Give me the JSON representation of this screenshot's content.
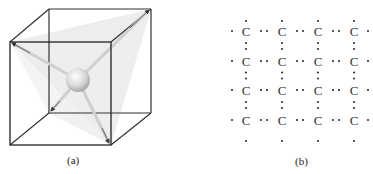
{
  "figure": {
    "panel_a": {
      "label": "(a)",
      "description": "Carbon atom at center of cube with four bonds to alternate corners (tetrahedral)"
    },
    "panel_b": {
      "label": "(b)",
      "atom_symbol": "C",
      "rows": 4,
      "cols": 4
    }
  },
  "grid": [
    [
      "C",
      "C",
      "C",
      "C"
    ],
    [
      "C",
      "C",
      "C",
      "C"
    ],
    [
      "C",
      "C",
      "C",
      "C"
    ],
    [
      "C",
      "C",
      "C",
      "C"
    ]
  ]
}
